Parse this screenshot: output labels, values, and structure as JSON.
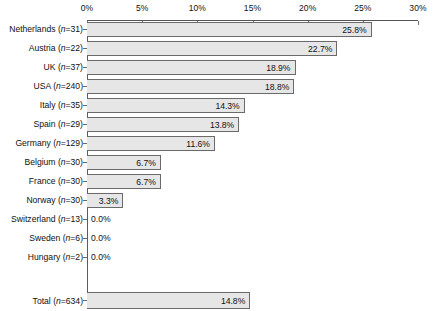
{
  "chart_data": {
    "type": "bar",
    "orientation": "horizontal",
    "title": "",
    "xlabel": "",
    "ylabel": "",
    "xlim": [
      0,
      30
    ],
    "xticks": [
      "0%",
      "5%",
      "10%",
      "15%",
      "20%",
      "25%",
      "30%"
    ],
    "xtick_values": [
      0,
      5,
      10,
      15,
      20,
      25,
      30
    ],
    "grid": false,
    "legend": "none",
    "value_suffix": "%",
    "categories": [
      "Netherlands",
      "Austria",
      "UK",
      "USA",
      "Italy",
      "Spain",
      "Germany",
      "Belgium",
      "France",
      "Norway",
      "Switzerland",
      "Sweden",
      "Hungary"
    ],
    "values": [
      25.8,
      22.7,
      18.9,
      18.8,
      14.3,
      13.8,
      11.6,
      6.7,
      6.7,
      3.3,
      0.0,
      0.0,
      0.0
    ],
    "counts": [
      31,
      22,
      37,
      240,
      35,
      29,
      129,
      30,
      30,
      30,
      13,
      6,
      2
    ],
    "rows": [
      {
        "label": "Netherlands",
        "n": "31",
        "value": 25.8,
        "value_text": "25.8%"
      },
      {
        "label": "Austria",
        "n": "22",
        "value": 22.7,
        "value_text": "22.7%"
      },
      {
        "label": "UK",
        "n": "37",
        "value": 18.9,
        "value_text": "18.9%"
      },
      {
        "label": "USA",
        "n": "240",
        "value": 18.8,
        "value_text": "18.8%"
      },
      {
        "label": "Italy",
        "n": "35",
        "value": 14.3,
        "value_text": "14.3%"
      },
      {
        "label": "Spain",
        "n": "29",
        "value": 13.8,
        "value_text": "13.8%"
      },
      {
        "label": "Germany",
        "n": "129",
        "value": 11.6,
        "value_text": "11.6%"
      },
      {
        "label": "Belgium",
        "n": "30",
        "value": 6.7,
        "value_text": "6.7%"
      },
      {
        "label": "France",
        "n": "30",
        "value": 6.7,
        "value_text": "6.7%"
      },
      {
        "label": "Norway",
        "n": "30",
        "value": 3.3,
        "value_text": "3.3%"
      },
      {
        "label": "Switzerland",
        "n": "13",
        "value": 0.0,
        "value_text": "0.0%"
      },
      {
        "label": "Sweden",
        "n": "6",
        "value": 0.0,
        "value_text": "0.0%"
      },
      {
        "label": "Hungary",
        "n": "2",
        "value": 0.0,
        "value_text": "0.0%"
      }
    ],
    "total_row": {
      "label": "Total",
      "n": "634",
      "value": 14.8,
      "value_text": "14.8%"
    },
    "colors": {
      "bar_fill": "#e6e6e6",
      "bar_border": "#6a6a6a",
      "axis": "#555555",
      "text": "#111111",
      "background": "#ffffff"
    }
  }
}
